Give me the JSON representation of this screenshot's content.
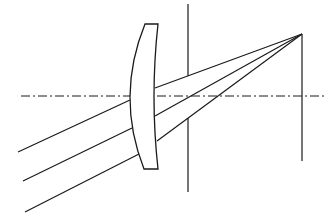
{
  "diagram": {
    "type": "optical-ray-diagram",
    "colors": {
      "stroke": "#1a1a1a",
      "background": "#ffffff"
    },
    "optical_axis": {
      "x1": 21,
      "y": 96,
      "x2": 324,
      "style": "dash-dot"
    },
    "lens": {
      "type": "meniscus",
      "top": {
        "y": 24,
        "x_left": 145,
        "x_right": 158
      },
      "bottom": {
        "y": 169,
        "x_left": 144,
        "x_right": 158
      },
      "left_surface_apex_x": 130,
      "right_surface_apex_x": 154
    },
    "aperture_stop": {
      "x": 188,
      "y_top": 4,
      "y_bottom": 192,
      "gap_top": 76,
      "gap_bottom": 118
    },
    "image_plane": {
      "x": 302,
      "y_top": 34,
      "y_bottom": 161
    },
    "focal_point": {
      "x": 302,
      "y": 34
    },
    "rays": [
      {
        "incoming": [
          [
            18,
            152
          ],
          [
            130,
            100
          ]
        ],
        "outgoing": [
          [
            155,
            88
          ],
          [
            302,
            34
          ]
        ]
      },
      {
        "incoming": [
          [
            23,
            181
          ],
          [
            132,
            128
          ]
        ],
        "outgoing": [
          [
            155,
            116
          ],
          [
            302,
            34
          ]
        ]
      },
      {
        "incoming": [
          [
            25,
            212
          ],
          [
            139,
            154
          ]
        ],
        "outgoing": [
          [
            157,
            141
          ],
          [
            302,
            34
          ]
        ]
      }
    ]
  }
}
